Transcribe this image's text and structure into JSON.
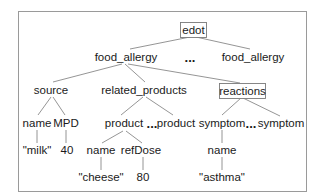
{
  "diagram": {
    "nodes": {
      "root": {
        "label": "edot",
        "boxed": true
      },
      "food_allergy_1": {
        "label": "food_allergy"
      },
      "ellipsis_food_allergy": {
        "label": "..."
      },
      "food_allergy_2": {
        "label": "food_allergy"
      },
      "source": {
        "label": "source"
      },
      "related_products": {
        "label": "related_products"
      },
      "reactions": {
        "label": "reactions",
        "boxed": true
      },
      "source_name": {
        "label": "name"
      },
      "source_mpd": {
        "label": "MPD"
      },
      "product_1": {
        "label": "product"
      },
      "ellipsis_product": {
        "label": "..."
      },
      "product_2": {
        "label": "product"
      },
      "symptom_1": {
        "label": "symptom"
      },
      "ellipsis_symptom": {
        "label": "..."
      },
      "symptom_2": {
        "label": "symptom"
      },
      "source_name_value": {
        "label": "\"milk\""
      },
      "source_mpd_value": {
        "label": "40"
      },
      "product_name": {
        "label": "name"
      },
      "product_refdose": {
        "label": "refDose"
      },
      "symptom_name": {
        "label": "name"
      },
      "product_name_value": {
        "label": "\"cheese\""
      },
      "product_refdose_value": {
        "label": "80"
      },
      "symptom_name_value": {
        "label": "\"asthma\""
      }
    },
    "edges": [
      [
        "root",
        "food_allergy_1"
      ],
      [
        "root",
        "food_allergy_2"
      ],
      [
        "food_allergy_1",
        "source"
      ],
      [
        "food_allergy_1",
        "related_products"
      ],
      [
        "food_allergy_1",
        "reactions"
      ],
      [
        "source",
        "source_name"
      ],
      [
        "source",
        "source_mpd"
      ],
      [
        "related_products",
        "product_1"
      ],
      [
        "related_products",
        "product_2"
      ],
      [
        "reactions",
        "symptom_1"
      ],
      [
        "reactions",
        "symptom_2"
      ],
      [
        "source_name",
        "source_name_value"
      ],
      [
        "source_mpd",
        "source_mpd_value"
      ],
      [
        "product_1",
        "product_name"
      ],
      [
        "product_1",
        "product_refdose"
      ],
      [
        "symptom_1",
        "symptom_name"
      ],
      [
        "product_name",
        "product_name_value"
      ],
      [
        "product_refdose",
        "product_refdose_value"
      ],
      [
        "symptom_name",
        "symptom_name_value"
      ]
    ]
  }
}
